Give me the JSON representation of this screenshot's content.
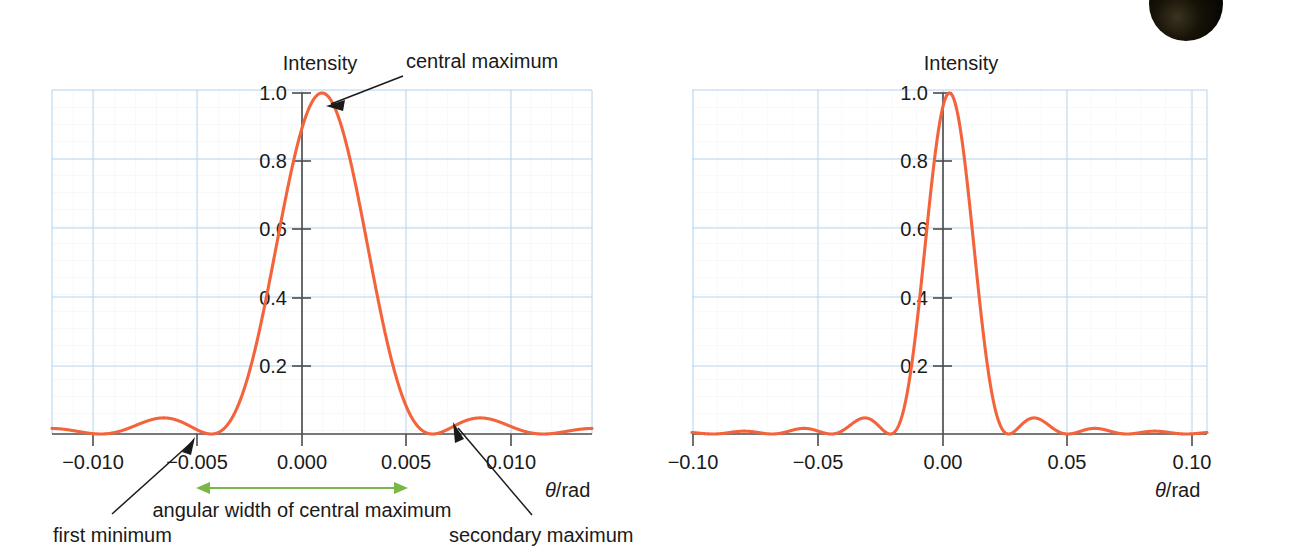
{
  "figure": {
    "title_hidden": "",
    "background_color": "#ffffff",
    "curve_color": "#f4643c",
    "grid_major_color": "#b9d4ea",
    "grid_minor_color": "#e4eff8",
    "axis_color": "#4b4b4b",
    "annotation_color": "#1a1a1a",
    "width_arrow_color": "#7ab648"
  },
  "decoration": {
    "moon_label": "dark-circle-photo",
    "moon_color": "#0a0805"
  },
  "chart_data": [
    {
      "id": "left",
      "type": "line",
      "title": "",
      "ylabel": "Intensity",
      "xlabel": "θ/rad",
      "xlabel_symbol": "θ",
      "xlabel_unit": "/rad",
      "xlim": [
        -0.0122,
        0.0122
      ],
      "ylim": [
        0,
        1.06
      ],
      "grid": true,
      "legend": "none",
      "xticks": [
        -0.01,
        -0.005,
        0.0,
        0.005,
        0.01
      ],
      "xticklabels": [
        "−0.010",
        "−0.005",
        "0.000",
        "0.005",
        "0.010"
      ],
      "yticks": [
        0.2,
        0.4,
        0.6,
        0.8,
        1.0
      ],
      "yticklabels": [
        "0.2",
        "0.4",
        "0.6",
        "0.8",
        "1.0"
      ],
      "function": "sinc2",
      "first_minimum_rad": 0.005,
      "samples_x": [
        -0.0122,
        -0.0118,
        -0.0114,
        -0.011,
        -0.0106,
        -0.0102,
        -0.0098,
        -0.0094,
        -0.009,
        -0.0086,
        -0.0082,
        -0.0078,
        -0.0074,
        -0.007,
        -0.0066,
        -0.0062,
        -0.0058,
        -0.0054,
        -0.005,
        -0.0046,
        -0.0042,
        -0.0038,
        -0.0034,
        -0.003,
        -0.0026,
        -0.0022,
        -0.0018,
        -0.0014,
        -0.001,
        -0.0006,
        -0.0002,
        0.0002,
        0.0006,
        0.001,
        0.0014,
        0.0018,
        0.0022,
        0.0026,
        0.003,
        0.0034,
        0.0038,
        0.0042,
        0.0046,
        0.005,
        0.0054,
        0.0058,
        0.0062,
        0.0066,
        0.007,
        0.0074,
        0.0078,
        0.0082,
        0.0086,
        0.009,
        0.0094,
        0.0098,
        0.0102,
        0.0106,
        0.011,
        0.0114,
        0.0118,
        0.0122
      ],
      "peak_value": 1.0,
      "secondary_maxima": [
        {
          "x": 0.00715,
          "y": 0.047
        },
        {
          "x": -0.00715,
          "y": 0.047
        },
        {
          "x": 0.01225,
          "y": 0.016
        },
        {
          "x": -0.01225,
          "y": 0.016
        }
      ],
      "annotations": [
        {
          "id": "central-maximum",
          "text": "central maximum",
          "target_x": 0.0007,
          "target_y": 0.985
        },
        {
          "id": "first-minimum",
          "text": "first minimum",
          "target_x": -0.005,
          "target_y": 0.0
        },
        {
          "id": "secondary-maximum",
          "text": "secondary maximum",
          "target_x": 0.00715,
          "target_y": 0.047
        },
        {
          "id": "angular-width",
          "text": "angular width of central maximum",
          "from_x": -0.005,
          "to_x": 0.005
        }
      ]
    },
    {
      "id": "right",
      "type": "line",
      "title": "",
      "ylabel": "Intensity",
      "xlabel": "θ/rad",
      "xlabel_symbol": "θ",
      "xlabel_unit": "/rad",
      "xlim": [
        -0.1045,
        0.1045
      ],
      "ylim": [
        0,
        1.06
      ],
      "grid": true,
      "legend": "none",
      "xticks": [
        -0.1,
        -0.05,
        0.0,
        0.05,
        0.1
      ],
      "xticklabels": [
        "−0.10",
        "−0.05",
        "0.00",
        "0.05",
        "0.10"
      ],
      "yticks": [
        0.2,
        0.4,
        0.6,
        0.8,
        1.0
      ],
      "yticklabels": [
        "0.2",
        "0.4",
        "0.6",
        "0.8",
        "1.0"
      ],
      "function": "sinc2",
      "first_minimum_rad": 0.024,
      "peak_value": 1.0,
      "secondary_maxima": [
        {
          "x": 0.0344,
          "y": 0.047
        },
        {
          "x": -0.0344,
          "y": 0.047
        },
        {
          "x": 0.0588,
          "y": 0.016
        },
        {
          "x": -0.0588,
          "y": 0.016
        },
        {
          "x": 0.083,
          "y": 0.008
        },
        {
          "x": -0.083,
          "y": 0.008
        }
      ],
      "annotations": []
    }
  ],
  "labels": {
    "intensity": "Intensity",
    "theta_symbol": "θ",
    "theta_unit": "/rad",
    "central_maximum": "central maximum",
    "first_minimum": "first minimum",
    "secondary_maximum": "secondary maximum",
    "angular_width": "angular width of central maximum"
  }
}
